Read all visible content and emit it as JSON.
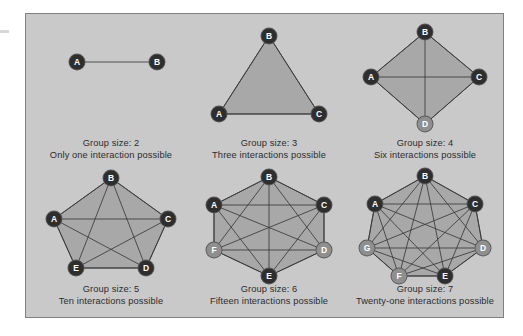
{
  "figure": {
    "background_color": "#c9c9c9",
    "border_color": "#808080",
    "node_dark_color": "#2e2e2e",
    "node_light_color": "#8f8f8f",
    "hull_fill_color": "#a8a8a8",
    "edge_color": "#3a3a3a",
    "text_color": "#2c2c2c"
  },
  "panels": [
    {
      "id": "group-2",
      "shape": "line",
      "group_size": 2,
      "interactions": 1,
      "caption_line1": "Group size: 2",
      "caption_line2": "Only one interaction possible",
      "nodes": [
        {
          "label": "A",
          "x": 42,
          "y": 42,
          "tone": "dark"
        },
        {
          "label": "B",
          "x": 122,
          "y": 42,
          "tone": "dark"
        }
      ],
      "edges": [
        [
          0,
          1
        ]
      ],
      "hull": []
    },
    {
      "id": "group-3",
      "shape": "triangle",
      "group_size": 3,
      "interactions": 3,
      "caption_line1": "Group size: 3",
      "caption_line2": "Three interactions possible",
      "nodes": [
        {
          "label": "B",
          "x": 76,
          "y": 16,
          "tone": "dark"
        },
        {
          "label": "A",
          "x": 26,
          "y": 94,
          "tone": "dark"
        },
        {
          "label": "C",
          "x": 126,
          "y": 94,
          "tone": "dark"
        }
      ],
      "edges": [
        [
          0,
          1
        ],
        [
          0,
          2
        ],
        [
          1,
          2
        ]
      ],
      "hull": [
        0,
        2,
        1
      ]
    },
    {
      "id": "group-4",
      "shape": "diamond",
      "group_size": 4,
      "interactions": 6,
      "caption_line1": "Group size: 4",
      "caption_line2": "Six interactions possible",
      "nodes": [
        {
          "label": "B",
          "x": 76,
          "y": 12,
          "tone": "dark"
        },
        {
          "label": "C",
          "x": 130,
          "y": 57,
          "tone": "dark"
        },
        {
          "label": "D",
          "x": 76,
          "y": 104,
          "tone": "light"
        },
        {
          "label": "A",
          "x": 22,
          "y": 57,
          "tone": "dark"
        }
      ],
      "edges": [
        [
          0,
          1
        ],
        [
          1,
          2
        ],
        [
          2,
          3
        ],
        [
          3,
          0
        ],
        [
          0,
          2
        ],
        [
          1,
          3
        ]
      ],
      "hull": [
        0,
        1,
        2,
        3
      ]
    },
    {
      "id": "group-5",
      "shape": "pentagon",
      "group_size": 5,
      "interactions": 10,
      "caption_line1": "Group size: 5",
      "caption_line2": "Ten interactions possible",
      "nodes": [
        {
          "label": "B",
          "x": 76,
          "y": 12,
          "tone": "dark"
        },
        {
          "label": "C",
          "x": 133,
          "y": 53,
          "tone": "dark"
        },
        {
          "label": "D",
          "x": 111,
          "y": 102,
          "tone": "dark"
        },
        {
          "label": "E",
          "x": 41,
          "y": 102,
          "tone": "dark"
        },
        {
          "label": "A",
          "x": 19,
          "y": 53,
          "tone": "dark"
        }
      ],
      "edges": [
        [
          0,
          1
        ],
        [
          1,
          2
        ],
        [
          2,
          3
        ],
        [
          3,
          4
        ],
        [
          4,
          0
        ],
        [
          0,
          2
        ],
        [
          0,
          3
        ],
        [
          1,
          3
        ],
        [
          1,
          4
        ],
        [
          2,
          4
        ]
      ],
      "hull": [
        0,
        1,
        2,
        3,
        4
      ]
    },
    {
      "id": "group-6",
      "shape": "hexagon",
      "group_size": 6,
      "interactions": 15,
      "caption_line1": "Group size: 6",
      "caption_line2": "Fifteen interactions possible",
      "nodes": [
        {
          "label": "B",
          "x": 76,
          "y": 11,
          "tone": "dark"
        },
        {
          "label": "C",
          "x": 131,
          "y": 39,
          "tone": "dark"
        },
        {
          "label": "D",
          "x": 131,
          "y": 84,
          "tone": "light"
        },
        {
          "label": "E",
          "x": 76,
          "y": 110,
          "tone": "dark"
        },
        {
          "label": "F",
          "x": 21,
          "y": 84,
          "tone": "light"
        },
        {
          "label": "A",
          "x": 21,
          "y": 39,
          "tone": "dark"
        }
      ],
      "edges": [
        [
          0,
          1
        ],
        [
          1,
          2
        ],
        [
          2,
          3
        ],
        [
          3,
          4
        ],
        [
          4,
          5
        ],
        [
          5,
          0
        ],
        [
          0,
          2
        ],
        [
          0,
          3
        ],
        [
          0,
          4
        ],
        [
          1,
          3
        ],
        [
          1,
          4
        ],
        [
          1,
          5
        ],
        [
          2,
          4
        ],
        [
          2,
          5
        ],
        [
          3,
          5
        ]
      ],
      "hull": [
        0,
        1,
        2,
        3,
        4,
        5
      ]
    },
    {
      "id": "group-7",
      "shape": "heptagon",
      "group_size": 7,
      "interactions": 21,
      "caption_line1": "Group size: 7",
      "caption_line2": "Twenty-one interactions possible",
      "nodes": [
        {
          "label": "B",
          "x": 76,
          "y": 10,
          "tone": "dark"
        },
        {
          "label": "C",
          "x": 126,
          "y": 38,
          "tone": "dark"
        },
        {
          "label": "D",
          "x": 134,
          "y": 82,
          "tone": "light"
        },
        {
          "label": "E",
          "x": 96,
          "y": 110,
          "tone": "dark"
        },
        {
          "label": "F",
          "x": 50,
          "y": 110,
          "tone": "light"
        },
        {
          "label": "G",
          "x": 18,
          "y": 82,
          "tone": "light"
        },
        {
          "label": "A",
          "x": 26,
          "y": 38,
          "tone": "dark"
        }
      ],
      "edges": [
        [
          0,
          1
        ],
        [
          1,
          2
        ],
        [
          2,
          3
        ],
        [
          3,
          4
        ],
        [
          4,
          5
        ],
        [
          5,
          6
        ],
        [
          6,
          0
        ],
        [
          0,
          2
        ],
        [
          0,
          3
        ],
        [
          0,
          4
        ],
        [
          0,
          5
        ],
        [
          1,
          3
        ],
        [
          1,
          4
        ],
        [
          1,
          5
        ],
        [
          1,
          6
        ],
        [
          2,
          4
        ],
        [
          2,
          5
        ],
        [
          2,
          6
        ],
        [
          3,
          5
        ],
        [
          3,
          6
        ],
        [
          4,
          6
        ]
      ],
      "hull": [
        0,
        1,
        2,
        3,
        4,
        5,
        6
      ]
    }
  ]
}
